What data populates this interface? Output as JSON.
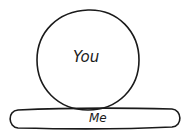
{
  "diagram": {
    "circle": {
      "label": "You"
    },
    "base": {
      "label": "Me"
    },
    "stroke_color": "#1a1a1a",
    "background": "#ffffff"
  }
}
